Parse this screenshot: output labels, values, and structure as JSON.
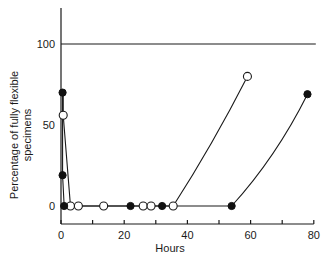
{
  "chart_data": {
    "type": "line",
    "title": "",
    "xlabel": "Hours",
    "ylabel": "Percentage of fully flexible specimens",
    "ylabel_lines": [
      "Percentage of fully flexible",
      "specimens"
    ],
    "xlim": [
      0,
      80
    ],
    "ylim": [
      -10,
      125
    ],
    "x_ticks": [
      0,
      20,
      40,
      60,
      80
    ],
    "x_minor_ticks": [
      10,
      30,
      50,
      70
    ],
    "y_ticks": [
      0,
      50,
      100
    ],
    "reference_line": {
      "y": 100,
      "x_range": [
        0,
        80
      ]
    },
    "grid": false,
    "legend": null,
    "series": [
      {
        "name": "filled circles",
        "marker": "filled-circle",
        "points": [
          [
            0.5,
            70
          ],
          [
            0.5,
            19
          ],
          [
            1,
            0
          ],
          [
            22,
            0
          ],
          [
            32,
            0
          ],
          [
            54,
            0
          ],
          [
            78,
            69
          ]
        ]
      },
      {
        "name": "open circles",
        "marker": "open-circle",
        "points": [
          [
            0.7,
            56
          ],
          [
            3,
            0
          ],
          [
            5.5,
            0
          ],
          [
            13.5,
            0
          ],
          [
            26,
            0
          ],
          [
            28.5,
            0
          ],
          [
            35.5,
            0
          ],
          [
            59,
            80
          ]
        ]
      }
    ]
  }
}
